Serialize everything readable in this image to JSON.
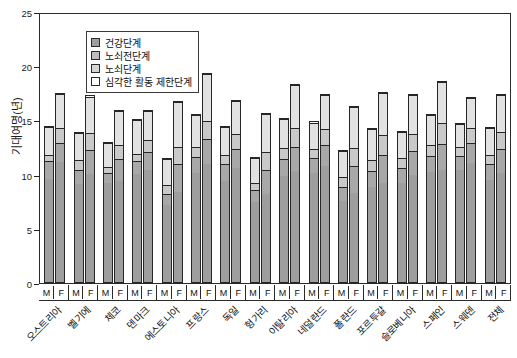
{
  "chart": {
    "type": "stacked_bar",
    "ylabel": "기대여명(년)",
    "yticks": [
      "0",
      "5",
      "10",
      "15",
      "20",
      "25"
    ]
  },
  "legend": {
    "items": [
      {
        "label": "건강단계",
        "swatch": "#9e9e9e"
      },
      {
        "label": "노쇠전단계",
        "swatch": "#bdbdbd"
      },
      {
        "label": "노쇠단계",
        "swatch": "#d6d6d6"
      },
      {
        "label": "심각한 활동 제한단계",
        "swatch": "#ffffff"
      }
    ]
  },
  "sex_labels": [
    "M",
    "F"
  ],
  "chart_data": {
    "type": "bar",
    "title": "",
    "xlabel": "",
    "ylabel": "기대여명(년)",
    "ylim": [
      0,
      25
    ],
    "grid": false,
    "legend_position": "top-left",
    "stacked": true,
    "categories": [
      "오스트리아",
      "벨기에",
      "체코",
      "덴마크",
      "에스토니아",
      "프랑스",
      "독일",
      "헝가리",
      "이탈리아",
      "네덜란드",
      "폴란드",
      "포르투갈",
      "슬로베니아",
      "스페인",
      "스웨덴",
      "전체"
    ],
    "subcategories": [
      "M",
      "F"
    ],
    "series": [
      {
        "name": "건강단계",
        "color": "#9e9e9e"
      },
      {
        "name": "노쇠전단계",
        "color": "#a8a8a8"
      },
      {
        "name": "노쇠단계",
        "color": "#c9c9c9"
      },
      {
        "name": "심각한 활동 제한단계",
        "color": "#e2e2e2"
      }
    ],
    "bars": [
      {
        "category": "오스트리아",
        "sex": "M",
        "total": 14.5,
        "segments": [
          9.6,
          1.7,
          0.6,
          2.6
        ]
      },
      {
        "category": "오스트리아",
        "sex": "F",
        "total": 17.5,
        "segments": [
          11.2,
          1.8,
          1.4,
          3.1
        ]
      },
      {
        "category": "벨기에",
        "sex": "M",
        "total": 13.9,
        "segments": [
          9.2,
          1.3,
          0.9,
          2.5
        ]
      },
      {
        "category": "벨기에",
        "sex": "F",
        "total": 17.3,
        "segments": [
          10.1,
          2.2,
          1.6,
          3.4
        ]
      },
      {
        "category": "체코",
        "sex": "M",
        "total": 13.0,
        "segments": [
          9.3,
          0.9,
          0.6,
          2.2
        ]
      },
      {
        "category": "체코",
        "sex": "F",
        "total": 16.0,
        "segments": [
          9.4,
          2.1,
          1.3,
          3.2
        ]
      },
      {
        "category": "덴마크",
        "sex": "M",
        "total": 15.1,
        "segments": [
          10.1,
          1.2,
          0.7,
          3.1
        ]
      },
      {
        "category": "덴마크",
        "sex": "F",
        "total": 16.0,
        "segments": [
          10.5,
          1.6,
          1.2,
          2.7
        ]
      },
      {
        "category": "에스토니아",
        "sex": "M",
        "total": 11.5,
        "segments": [
          7.2,
          1.1,
          0.8,
          2.4
        ]
      },
      {
        "category": "에스토니아",
        "sex": "F",
        "total": 16.8,
        "segments": [
          8.4,
          2.6,
          1.6,
          4.2
        ]
      },
      {
        "category": "프랑스",
        "sex": "M",
        "total": 15.6,
        "segments": [
          10.2,
          1.5,
          0.9,
          3.0
        ]
      },
      {
        "category": "프랑스",
        "sex": "F",
        "total": 19.4,
        "segments": [
          11.0,
          2.3,
          1.7,
          4.4
        ]
      },
      {
        "category": "독일",
        "sex": "M",
        "total": 14.5,
        "segments": [
          9.4,
          1.6,
          0.9,
          2.6
        ]
      },
      {
        "category": "독일",
        "sex": "F",
        "total": 16.9,
        "segments": [
          10.6,
          1.8,
          1.4,
          3.1
        ]
      },
      {
        "category": "헝가리",
        "sex": "M",
        "total": 11.6,
        "segments": [
          7.5,
          1.1,
          0.7,
          2.3
        ]
      },
      {
        "category": "헝가리",
        "sex": "F",
        "total": 15.7,
        "segments": [
          8.2,
          2.3,
          1.6,
          3.6
        ]
      },
      {
        "category": "이탈리아",
        "sex": "M",
        "total": 15.2,
        "segments": [
          9.9,
          1.6,
          1.0,
          2.7
        ]
      },
      {
        "category": "이탈리아",
        "sex": "F",
        "total": 18.4,
        "segments": [
          10.3,
          2.3,
          1.8,
          4.0
        ]
      },
      {
        "category": "네덜란드",
        "sex": "M",
        "total": 14.9,
        "segments": [
          10.2,
          1.4,
          0.8,
          2.5
        ]
      },
      {
        "category": "네덜란드",
        "sex": "F",
        "total": 17.4,
        "segments": [
          10.8,
          2.0,
          1.5,
          3.1
        ]
      },
      {
        "category": "폴란드",
        "sex": "M",
        "total": 12.3,
        "segments": [
          7.6,
          1.3,
          0.9,
          2.5
        ]
      },
      {
        "category": "폴란드",
        "sex": "F",
        "total": 16.3,
        "segments": [
          8.3,
          2.5,
          1.7,
          3.8
        ]
      },
      {
        "category": "포르투갈",
        "sex": "M",
        "total": 14.3,
        "segments": [
          8.9,
          1.5,
          1.0,
          2.9
        ]
      },
      {
        "category": "포르투갈",
        "sex": "F",
        "total": 17.6,
        "segments": [
          9.2,
          2.6,
          1.9,
          3.9
        ]
      },
      {
        "category": "슬로베니아",
        "sex": "M",
        "total": 14.0,
        "segments": [
          9.3,
          1.4,
          0.9,
          2.4
        ]
      },
      {
        "category": "슬로베니아",
        "sex": "F",
        "total": 17.4,
        "segments": [
          10.0,
          2.2,
          1.6,
          3.6
        ]
      },
      {
        "category": "스페인",
        "sex": "M",
        "total": 15.6,
        "segments": [
          10.3,
          1.5,
          1.0,
          2.8
        ]
      },
      {
        "category": "스페인",
        "sex": "F",
        "total": 18.6,
        "segments": [
          10.4,
          2.5,
          1.9,
          3.8
        ]
      },
      {
        "category": "스웨덴",
        "sex": "M",
        "total": 14.8,
        "segments": [
          10.5,
          1.3,
          0.8,
          2.2
        ]
      },
      {
        "category": "스웨덴",
        "sex": "F",
        "total": 17.2,
        "segments": [
          11.1,
          1.9,
          1.4,
          2.8
        ]
      },
      {
        "category": "전체",
        "sex": "M",
        "total": 14.4,
        "segments": [
          9.5,
          1.5,
          0.9,
          2.5
        ]
      },
      {
        "category": "전체",
        "sex": "F",
        "total": 17.4,
        "segments": [
          10.2,
          2.2,
          1.6,
          3.4
        ]
      }
    ]
  }
}
